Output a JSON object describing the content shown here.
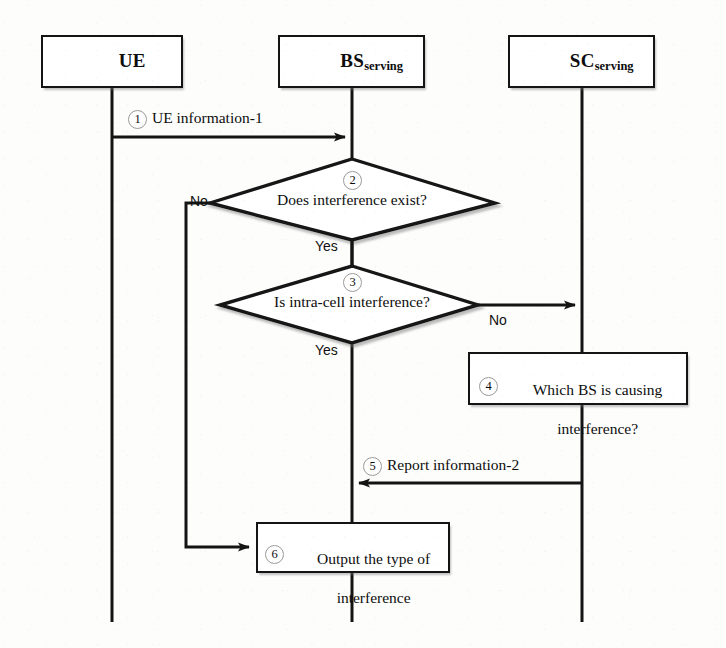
{
  "figure": {
    "type": "sequence-flowchart",
    "background_color": "#fdfdfc",
    "line_color": "#141414",
    "badge_ring_color": "#9a9a9a"
  },
  "actors": [
    {
      "id": "ue",
      "name": "UE",
      "subscript": "",
      "lifeline_x": 112
    },
    {
      "id": "bs",
      "name": "BS",
      "subscript": "serving",
      "lifeline_x": 352
    },
    {
      "id": "sc",
      "name": "SC",
      "subscript": "serving",
      "lifeline_x": 582
    }
  ],
  "messages": [
    {
      "step": "1",
      "label": "UE information-1",
      "from": "ue",
      "to": "bs"
    },
    {
      "step": "5",
      "label": "Report information-2",
      "from": "sc",
      "to": "bs"
    }
  ],
  "decisions": [
    {
      "step": "2",
      "label": "Does interference exist?",
      "yes_label": "Yes",
      "no_label": "No"
    },
    {
      "step": "3",
      "label": "Is intra-cell interference?",
      "yes_label": "Yes",
      "no_label": "No"
    }
  ],
  "processes": [
    {
      "step": "4",
      "line1": "Which BS is causing",
      "line2": "interference?"
    },
    {
      "step": "6",
      "line1": "Output the type of",
      "line2": "interference"
    }
  ],
  "badges": [
    "1",
    "2",
    "3",
    "4",
    "5",
    "6"
  ]
}
